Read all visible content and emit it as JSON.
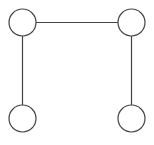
{
  "diagram": {
    "type": "graph",
    "background": "#ffffff",
    "stroke_color": "#444444",
    "node_fill": "#ffffff",
    "node_radius": 13.5,
    "nodes": [
      {
        "id": "top-left",
        "cx": 22.5,
        "cy": 22.5
      },
      {
        "id": "top-right",
        "cx": 131.5,
        "cy": 22.5
      },
      {
        "id": "bottom-left",
        "cx": 22.5,
        "cy": 118.5
      },
      {
        "id": "bottom-right",
        "cx": 131.5,
        "cy": 118.5
      }
    ],
    "edges": [
      {
        "from": "top-left",
        "to": "top-right"
      },
      {
        "from": "top-left",
        "to": "bottom-left"
      },
      {
        "from": "top-right",
        "to": "bottom-right"
      }
    ]
  }
}
